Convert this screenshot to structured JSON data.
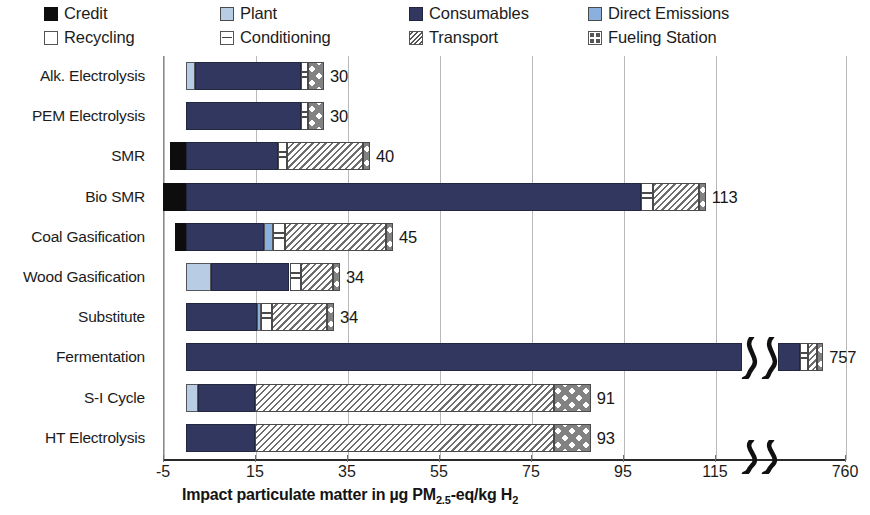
{
  "legend": {
    "items": [
      {
        "label": "Credit",
        "key": "credit",
        "swatch": "credit-swatch"
      },
      {
        "label": "Plant",
        "key": "plant",
        "swatch": "plant-swatch"
      },
      {
        "label": "Consumables",
        "key": "consumables",
        "swatch": "consumables-swatch"
      },
      {
        "label": "Direct Emissions",
        "key": "direct",
        "swatch": "direct-emissions-swatch"
      },
      {
        "label": "Recycling",
        "key": "recycling",
        "swatch": "recycling-swatch"
      },
      {
        "label": "Conditioning",
        "key": "conditioning",
        "swatch": "conditioning-swatch"
      },
      {
        "label": "Transport",
        "key": "transport",
        "swatch": "transport-swatch"
      },
      {
        "label": "Fueling Station",
        "key": "fueling",
        "swatch": "fueling-station-swatch"
      }
    ]
  },
  "axis": {
    "x_title_html": "Impact particulate matter in µg PM2.5-eq/kg H2",
    "x_title_main_a": "Impact particulate matter in µg PM",
    "x_title_sub_a": "2.5",
    "x_title_main_b": "-eq/kg H",
    "x_title_sub_b": "2",
    "x_ticks": [
      "-5",
      "15",
      "35",
      "55",
      "75",
      "95",
      "115",
      "760"
    ],
    "break_marker": "ΖΖ"
  },
  "chart_data": {
    "type": "bar",
    "orientation": "horizontal",
    "stacked": true,
    "title": "",
    "xlabel": "Impact particulate matter in µg PM2.5-eq/kg H2",
    "ylabel": "",
    "xlim": [
      -5,
      120
    ],
    "x_ticks": [
      -5,
      15,
      35,
      55,
      75,
      95,
      115,
      760
    ],
    "axis_break": {
      "after": 120,
      "resumes_at": 750,
      "label": "760"
    },
    "grid": "vertical",
    "legend_position": "top",
    "series": [
      {
        "name": "Credit",
        "color": "#0d0d0d",
        "pattern": "solid"
      },
      {
        "name": "Plant",
        "color": "#b8cce4",
        "pattern": "solid"
      },
      {
        "name": "Consumables",
        "color": "#32375f",
        "pattern": "solid"
      },
      {
        "name": "Direct Emissions",
        "color": "#8ab0dd",
        "pattern": "solid"
      },
      {
        "name": "Recycling",
        "color": "#ffffff",
        "pattern": "solid-outline"
      },
      {
        "name": "Conditioning",
        "color": "#ffffff",
        "pattern": "horizontal-lines"
      },
      {
        "name": "Transport",
        "color": "#ffffff",
        "pattern": "diagonal-hatch"
      },
      {
        "name": "Fueling Station",
        "color": "#ffffff",
        "pattern": "cross-diamond"
      }
    ],
    "categories": [
      "Alk. Electrolysis",
      "PEM Electrolysis",
      "SMR",
      "Bio SMR",
      "Coal Gasification",
      "Wood Gasification",
      "Substitute",
      "Fermentation",
      "S-I Cycle",
      "HT Electrolysis"
    ],
    "totals": [
      30,
      30,
      40,
      113,
      45,
      34,
      34,
      757,
      91,
      93
    ],
    "total_labels": [
      "30",
      "30",
      "40",
      "113",
      "45",
      "34",
      "34",
      "757",
      "91",
      "93"
    ],
    "rows": [
      {
        "category": "Alk. Electrolysis",
        "total": 30,
        "label": "30",
        "segments": [
          {
            "name": "Plant",
            "value": 2.0
          },
          {
            "name": "Consumables",
            "value": 23.0
          },
          {
            "name": "Conditioning",
            "value": 1.5
          },
          {
            "name": "Fueling Station",
            "value": 3.5
          }
        ]
      },
      {
        "category": "PEM Electrolysis",
        "total": 30,
        "label": "30",
        "segments": [
          {
            "name": "Consumables",
            "value": 25.0
          },
          {
            "name": "Conditioning",
            "value": 1.5
          },
          {
            "name": "Fueling Station",
            "value": 3.5
          }
        ]
      },
      {
        "category": "SMR",
        "total": 40,
        "label": "40",
        "segments": [
          {
            "name": "Credit",
            "value": -3.5
          },
          {
            "name": "Consumables",
            "value": 20.0
          },
          {
            "name": "Conditioning",
            "value": 2.0
          },
          {
            "name": "Transport",
            "value": 16.5
          },
          {
            "name": "Fueling Station",
            "value": 1.5
          }
        ]
      },
      {
        "category": "Bio SMR",
        "total": 113,
        "label": "113",
        "segments": [
          {
            "name": "Credit",
            "value": -5.0
          },
          {
            "name": "Consumables",
            "value": 99.0
          },
          {
            "name": "Conditioning",
            "value": 2.5
          },
          {
            "name": "Transport",
            "value": 10.0
          },
          {
            "name": "Fueling Station",
            "value": 1.5
          }
        ]
      },
      {
        "category": "Coal Gasification",
        "total": 45,
        "label": "45",
        "segments": [
          {
            "name": "Credit",
            "value": -2.5
          },
          {
            "name": "Consumables",
            "value": 17.0
          },
          {
            "name": "Direct Emissions",
            "value": 2.0
          },
          {
            "name": "Conditioning",
            "value": 2.5
          },
          {
            "name": "Transport",
            "value": 22.0
          },
          {
            "name": "Fueling Station",
            "value": 1.5
          }
        ]
      },
      {
        "category": "Wood Gasification",
        "total": 34,
        "label": "34",
        "segments": [
          {
            "name": "Plant",
            "value": 5.5
          },
          {
            "name": "Consumables",
            "value": 17.0
          },
          {
            "name": "Conditioning",
            "value": 2.5
          },
          {
            "name": "Transport",
            "value": 7.0
          },
          {
            "name": "Fueling Station",
            "value": 1.5
          }
        ]
      },
      {
        "category": "Substitute",
        "total": 34,
        "label": "34",
        "segments": [
          {
            "name": "Consumables",
            "value": 15.5
          },
          {
            "name": "Direct Emissions",
            "value": 0.7
          },
          {
            "name": "Conditioning",
            "value": 2.5
          },
          {
            "name": "Transport",
            "value": 12.0
          },
          {
            "name": "Fueling Station",
            "value": 1.5
          }
        ]
      },
      {
        "category": "Fermentation",
        "total": 757,
        "label": "757",
        "segments": [
          {
            "name": "Consumables",
            "value": 745.0
          },
          {
            "name": "Conditioning",
            "value": 3.5
          },
          {
            "name": "Transport",
            "value": 4.0
          },
          {
            "name": "Fueling Station",
            "value": 2.0
          }
        ]
      },
      {
        "category": "S-I Cycle",
        "total": 91,
        "label": "91",
        "segments": [
          {
            "name": "Plant",
            "value": 2.5
          },
          {
            "name": "Consumables",
            "value": 12.5
          },
          {
            "name": "Transport",
            "value": 65.0
          },
          {
            "name": "Fueling Station",
            "value": 8.0
          }
        ]
      },
      {
        "category": "HT Electrolysis",
        "total": 93,
        "label": "93",
        "segments": [
          {
            "name": "Consumables",
            "value": 15.0
          },
          {
            "name": "Transport",
            "value": 65.0
          },
          {
            "name": "Fueling Station",
            "value": 8.0
          }
        ]
      }
    ]
  }
}
